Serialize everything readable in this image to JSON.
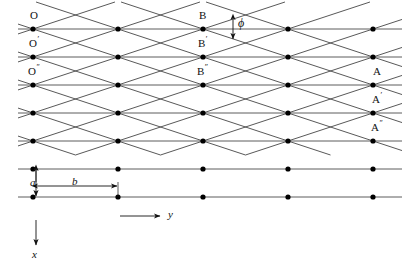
{
  "figure": {
    "type": "lattice-diagram",
    "background_color": "#ffffff",
    "line_color": "#333333",
    "dot_color": "#000000",
    "annotation_color": "#111111"
  },
  "geometry": {
    "row_count": 7,
    "row_spacing_px": 28,
    "first_row_y": 29,
    "column_count": 5,
    "column_spacing_px": 85,
    "first_column_x": 33,
    "diagonal_slope_rows_per_column": 1,
    "diagonal_down_count": 8,
    "diagonal_up_count": 8
  },
  "labels": {
    "left_column": [
      {
        "text": "O",
        "prime": "",
        "x": 30,
        "y": 10,
        "row": 0
      },
      {
        "text": "O",
        "prime": "′",
        "x": 28,
        "y": 38,
        "row": 1
      },
      {
        "text": "O",
        "prime": "″",
        "x": 27,
        "y": 66,
        "row": 2
      }
    ],
    "middle_column": [
      {
        "text": "B",
        "prime": "",
        "x": 198,
        "y": 10,
        "row": 0
      },
      {
        "text": "B",
        "prime": "′",
        "x": 196,
        "y": 38,
        "row": 1
      },
      {
        "text": "B",
        "prime": "″",
        "x": 195,
        "y": 66,
        "row": 2
      }
    ],
    "right_column": [
      {
        "text": "A",
        "prime": "",
        "x": 372,
        "y": 66,
        "row": 2
      },
      {
        "text": "A",
        "prime": "′",
        "x": 370,
        "y": 94,
        "row": 3
      },
      {
        "text": "A",
        "prime": "″",
        "x": 369,
        "y": 122,
        "row": 4
      }
    ],
    "angle": {
      "symbol": "ϕ",
      "name": "phi",
      "x": 237,
      "y": 22
    },
    "spacing_vertical": {
      "symbol": "a",
      "name": "a",
      "x": 30,
      "y": 183
    },
    "spacing_horizontal": {
      "symbol": "b",
      "name": "b",
      "x": 72,
      "y": 188
    },
    "axis_y": {
      "symbol": "y",
      "name": "y-axis",
      "x": 170,
      "y": 213
    },
    "axis_x": {
      "symbol": "x",
      "name": "x-axis",
      "x": 32,
      "y": 250
    }
  },
  "axes": {
    "y_axis": {
      "from_x": 120,
      "to_x": 160,
      "y": 216,
      "direction": "right"
    },
    "x_axis": {
      "x": 36,
      "from_y": 220,
      "to_y": 245,
      "direction": "down"
    }
  },
  "dimension_markers": {
    "a": {
      "x": 36,
      "top_y": 169,
      "bottom_y": 197,
      "double_headed": true
    },
    "b": {
      "y": 186,
      "left_x": 36,
      "right_x": 118,
      "double_headed": true,
      "tick_left_from_y": 169,
      "tick_right_from_y": 197
    }
  }
}
